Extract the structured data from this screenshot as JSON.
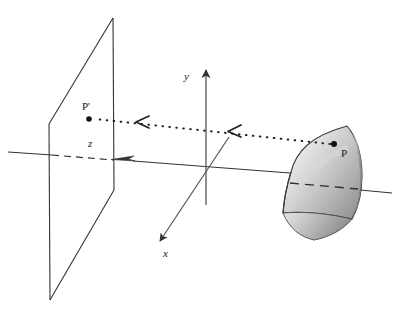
{
  "figure": {
    "type": "geometric-diagram",
    "width": 396,
    "height": 317,
    "background_color": "#ffffff",
    "line_color": "#333333"
  },
  "axes": {
    "x": {
      "label": "x",
      "label_x": 166,
      "label_y": 255,
      "direction": "down-left",
      "arrow": true,
      "from": [
        206,
        172
      ],
      "to": [
        158,
        243
      ]
    },
    "y": {
      "label": "y",
      "label_x": 186,
      "label_y": 80,
      "direction": "up",
      "arrow": true,
      "from": [
        206,
        190
      ],
      "to": [
        206,
        62
      ]
    },
    "z": {
      "label": "z",
      "label_x": 90,
      "label_y": 146,
      "direction": "left",
      "arrow": true,
      "from": [
        262,
        178
      ],
      "to": [
        57,
        162
      ],
      "dashed_segment": true
    }
  },
  "projection_plane": {
    "name": "image-plane",
    "shape": "parallelogram",
    "corners": [
      [
        113,
        18
      ],
      [
        114,
        190
      ],
      [
        50,
        300
      ],
      [
        49,
        124
      ]
    ],
    "stroke": "#333333",
    "fill": "none"
  },
  "surface": {
    "name": "curved-surface-patch",
    "shading": "gradient-light-to-dark",
    "fill_light": "#f2f2f2",
    "fill_mid": "#c8c8c8",
    "fill_dark": "#8a8a8a",
    "stroke": "#3a3a3a"
  },
  "points": [
    {
      "id": "P",
      "label": "P",
      "description": "point on the curved surface",
      "x": 334,
      "y": 144,
      "label_x": 341,
      "label_y": 156,
      "marker": "filled-dot"
    },
    {
      "id": "Pprime",
      "label": "P'",
      "description": "projected image of P on the projection plane",
      "x": 89,
      "y": 119,
      "label_x": 85,
      "label_y": 110,
      "marker": "filled-dot"
    }
  ],
  "projection_ray": {
    "name": "projector-line",
    "style": "dotted",
    "from": [
      334,
      144
    ],
    "to": [
      92,
      119
    ],
    "arrow_markers": [
      {
        "x": 232,
        "y": 131,
        "glyph": "<"
      },
      {
        "x": 140,
        "y": 122,
        "glyph": "<"
      }
    ],
    "direction": "from P toward P-prime"
  },
  "hidden_line": {
    "name": "occluded-axis-segment",
    "style": "dashed",
    "description": "portion of z-axis hidden behind the surface patch"
  }
}
